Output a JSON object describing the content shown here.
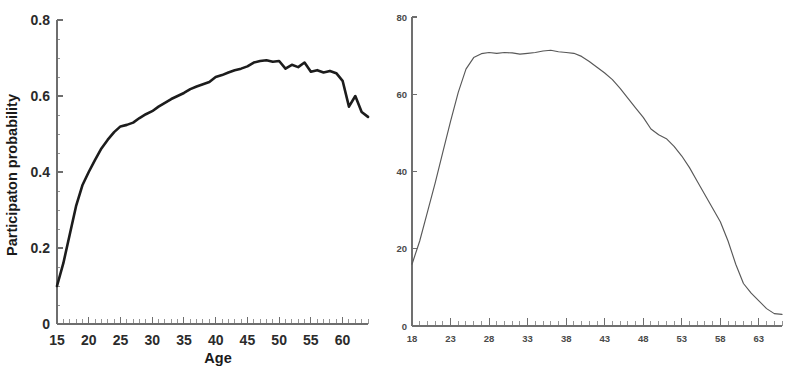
{
  "figure": {
    "background_color": "#ffffff",
    "panel_count": 2
  },
  "chart_data": [
    {
      "panel": "left",
      "type": "line",
      "title": "",
      "xlabel": "Age",
      "ylabel": "Participaton probability",
      "xlim": [
        15,
        64
      ],
      "ylim": [
        0,
        0.8
      ],
      "xticks": [
        15,
        20,
        25,
        30,
        35,
        40,
        45,
        50,
        55,
        60
      ],
      "xticklabels": [
        "15",
        "20",
        "25",
        "30",
        "35",
        "40",
        "45",
        "50",
        "55",
        "60"
      ],
      "yticks": [
        0,
        0.2,
        0.4,
        0.6,
        0.8
      ],
      "yticklabels": [
        "0",
        "0.2",
        "0.4",
        "0.6",
        "0.8"
      ],
      "minor_xtick_step": 1,
      "minor_ytick_step": 0.05,
      "grid": false,
      "legend": null,
      "line_color": "#1c1c1c",
      "x": [
        15,
        16,
        17,
        18,
        19,
        20,
        21,
        22,
        23,
        24,
        25,
        26,
        27,
        28,
        29,
        30,
        31,
        32,
        33,
        34,
        35,
        36,
        37,
        38,
        39,
        40,
        41,
        42,
        43,
        44,
        45,
        46,
        47,
        48,
        49,
        50,
        51,
        52,
        53,
        54,
        55,
        56,
        57,
        58,
        59,
        60,
        61,
        62,
        63,
        64
      ],
      "y": [
        0.1,
        0.16,
        0.235,
        0.31,
        0.365,
        0.4,
        0.432,
        0.462,
        0.485,
        0.505,
        0.52,
        0.524,
        0.53,
        0.542,
        0.552,
        0.56,
        0.572,
        0.582,
        0.592,
        0.6,
        0.608,
        0.618,
        0.625,
        0.631,
        0.637,
        0.65,
        0.655,
        0.662,
        0.668,
        0.672,
        0.678,
        0.688,
        0.692,
        0.694,
        0.69,
        0.692,
        0.672,
        0.682,
        0.676,
        0.688,
        0.664,
        0.668,
        0.662,
        0.666,
        0.66,
        0.64,
        0.572,
        0.6,
        0.558,
        0.545
      ]
    },
    {
      "panel": "right",
      "type": "line",
      "title": "",
      "xlabel": "Age",
      "ylabel": "",
      "xlim": [
        18,
        66
      ],
      "ylim": [
        0,
        80
      ],
      "xticks": [
        18,
        23,
        28,
        33,
        38,
        43,
        48,
        53,
        58,
        63
      ],
      "xticklabels": [
        "18",
        "23",
        "28",
        "33",
        "38",
        "43",
        "48",
        "53",
        "58",
        "63"
      ],
      "yticks": [
        0,
        20,
        40,
        60,
        80
      ],
      "yticklabels": [
        "0",
        "20",
        "40",
        "60",
        "80"
      ],
      "minor_xtick_step": 1,
      "minor_ytick_step": 5,
      "grid": false,
      "legend": null,
      "line_color": "#585858",
      "x": [
        18,
        19,
        20,
        21,
        22,
        23,
        24,
        25,
        26,
        27,
        28,
        29,
        30,
        31,
        32,
        33,
        34,
        35,
        36,
        37,
        38,
        39,
        40,
        41,
        42,
        43,
        44,
        45,
        46,
        47,
        48,
        49,
        50,
        51,
        52,
        53,
        54,
        55,
        56,
        57,
        58,
        59,
        60,
        61,
        62,
        63,
        64,
        65,
        66
      ],
      "y": [
        16.0,
        22.0,
        29.5,
        37.0,
        45.0,
        53.0,
        60.5,
        66.5,
        69.5,
        70.5,
        70.8,
        70.6,
        70.8,
        70.7,
        70.4,
        70.6,
        70.8,
        71.2,
        71.4,
        71.0,
        70.8,
        70.6,
        69.8,
        68.5,
        67.0,
        65.5,
        63.8,
        61.5,
        59.0,
        56.5,
        54.0,
        51.0,
        49.5,
        48.5,
        46.5,
        44.0,
        41.0,
        37.5,
        34.0,
        30.5,
        27.0,
        22.0,
        16.0,
        11.0,
        8.5,
        6.5,
        4.5,
        3.2,
        3.0
      ]
    }
  ]
}
